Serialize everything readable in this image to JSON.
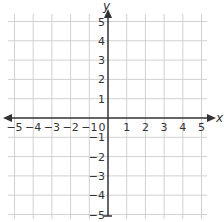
{
  "chart_data": {
    "type": "scatter",
    "title": "",
    "xlabel": "x",
    "ylabel": "y",
    "xlim": [
      -5,
      5
    ],
    "ylim": [
      -5,
      5
    ],
    "grid": true,
    "x_ticks": [
      -5,
      -4,
      -3,
      -2,
      -1,
      0,
      1,
      2,
      3,
      4,
      5
    ],
    "y_ticks": [
      -5,
      -4,
      -3,
      -2,
      -1,
      1,
      2,
      3,
      4,
      5
    ],
    "x_tick_labels": [
      "−5",
      "−4",
      "−3",
      "−2",
      "−1",
      "0",
      "1",
      "2",
      "3",
      "4",
      "5"
    ],
    "y_tick_labels": [
      "−5",
      "−4",
      "−3",
      "−2",
      "−1",
      "1",
      "2",
      "3",
      "4",
      "5"
    ],
    "points": [],
    "series": []
  },
  "colors": {
    "grid": "#d0d0d0",
    "axis": "#333333",
    "text": "#333333",
    "background": "#ffffff"
  }
}
